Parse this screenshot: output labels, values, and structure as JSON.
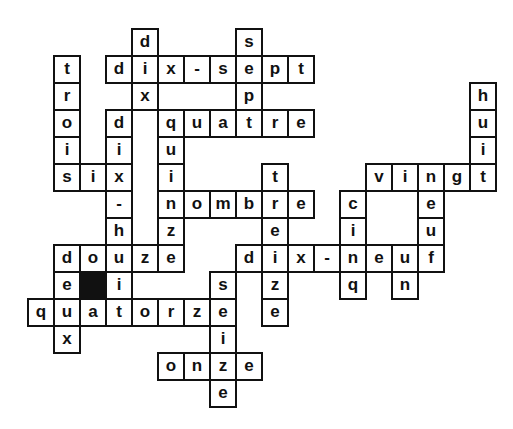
{
  "puzzle": {
    "type": "crossword",
    "language": "French",
    "theme": "numbers",
    "grid_origin": {
      "x": 27,
      "y": 28
    },
    "cell_size": {
      "w": 26,
      "h": 27
    },
    "colors": {
      "border": "#111111",
      "fill": "#ffffff",
      "block": "#111111",
      "text": "#111111"
    },
    "words": [
      {
        "word": "dix-sept",
        "dir": "across",
        "row": 1,
        "col": 3
      },
      {
        "word": "dix",
        "dir": "down",
        "row": 0,
        "col": 4
      },
      {
        "word": "sept",
        "dir": "down",
        "row": 0,
        "col": 8
      },
      {
        "word": "trois",
        "dir": "down",
        "row": 1,
        "col": 1
      },
      {
        "word": "quatre",
        "dir": "across",
        "row": 3,
        "col": 5
      },
      {
        "word": "dix-huit",
        "dir": "down",
        "row": 3,
        "col": 3
      },
      {
        "word": "quinze",
        "dir": "down",
        "row": 3,
        "col": 5
      },
      {
        "word": "six",
        "dir": "across",
        "row": 5,
        "col": 1
      },
      {
        "word": "nombre",
        "dir": "across",
        "row": 6,
        "col": 5
      },
      {
        "word": "treize",
        "dir": "down",
        "row": 5,
        "col": 9
      },
      {
        "word": "huit",
        "dir": "down",
        "row": 2,
        "col": 17
      },
      {
        "word": "vingt",
        "dir": "across",
        "row": 5,
        "col": 13
      },
      {
        "word": "neuf",
        "dir": "down",
        "row": 5,
        "col": 15
      },
      {
        "word": "cinq",
        "dir": "down",
        "row": 6,
        "col": 12
      },
      {
        "word": "douze",
        "dir": "across",
        "row": 8,
        "col": 1
      },
      {
        "word": "deux",
        "dir": "down",
        "row": 8,
        "col": 1
      },
      {
        "word": "dix-neuf",
        "dir": "across",
        "row": 8,
        "col": 8
      },
      {
        "word": "un",
        "dir": "down",
        "row": 8,
        "col": 14
      },
      {
        "word": "quatorze",
        "dir": "across",
        "row": 10,
        "col": 0
      },
      {
        "word": "seize",
        "dir": "down",
        "row": 9,
        "col": 7
      },
      {
        "word": "onze",
        "dir": "across",
        "row": 12,
        "col": 5
      }
    ],
    "blocks": [
      {
        "row": 9,
        "col": 2
      }
    ],
    "cells": [
      {
        "r": 0,
        "c": 4,
        "l": "d"
      },
      {
        "r": 0,
        "c": 8,
        "l": "s"
      },
      {
        "r": 1,
        "c": 1,
        "l": "t"
      },
      {
        "r": 1,
        "c": 3,
        "l": "d"
      },
      {
        "r": 1,
        "c": 4,
        "l": "i"
      },
      {
        "r": 1,
        "c": 5,
        "l": "x"
      },
      {
        "r": 1,
        "c": 6,
        "l": "-"
      },
      {
        "r": 1,
        "c": 7,
        "l": "s"
      },
      {
        "r": 1,
        "c": 8,
        "l": "e"
      },
      {
        "r": 1,
        "c": 9,
        "l": "p"
      },
      {
        "r": 1,
        "c": 10,
        "l": "t"
      },
      {
        "r": 2,
        "c": 1,
        "l": "r"
      },
      {
        "r": 2,
        "c": 4,
        "l": "x"
      },
      {
        "r": 2,
        "c": 8,
        "l": "p"
      },
      {
        "r": 2,
        "c": 17,
        "l": "h"
      },
      {
        "r": 3,
        "c": 1,
        "l": "o"
      },
      {
        "r": 3,
        "c": 3,
        "l": "d"
      },
      {
        "r": 3,
        "c": 5,
        "l": "q"
      },
      {
        "r": 3,
        "c": 6,
        "l": "u"
      },
      {
        "r": 3,
        "c": 7,
        "l": "a"
      },
      {
        "r": 3,
        "c": 8,
        "l": "t"
      },
      {
        "r": 3,
        "c": 9,
        "l": "r"
      },
      {
        "r": 3,
        "c": 10,
        "l": "e"
      },
      {
        "r": 3,
        "c": 17,
        "l": "u"
      },
      {
        "r": 4,
        "c": 1,
        "l": "i"
      },
      {
        "r": 4,
        "c": 3,
        "l": "i"
      },
      {
        "r": 4,
        "c": 5,
        "l": "u"
      },
      {
        "r": 4,
        "c": 17,
        "l": "i"
      },
      {
        "r": 5,
        "c": 1,
        "l": "s"
      },
      {
        "r": 5,
        "c": 2,
        "l": "i"
      },
      {
        "r": 5,
        "c": 3,
        "l": "x"
      },
      {
        "r": 5,
        "c": 5,
        "l": "i"
      },
      {
        "r": 5,
        "c": 9,
        "l": "t"
      },
      {
        "r": 5,
        "c": 13,
        "l": "v"
      },
      {
        "r": 5,
        "c": 14,
        "l": "i"
      },
      {
        "r": 5,
        "c": 15,
        "l": "n"
      },
      {
        "r": 5,
        "c": 16,
        "l": "g"
      },
      {
        "r": 5,
        "c": 17,
        "l": "t"
      },
      {
        "r": 6,
        "c": 3,
        "l": "-"
      },
      {
        "r": 6,
        "c": 5,
        "l": "n"
      },
      {
        "r": 6,
        "c": 6,
        "l": "o"
      },
      {
        "r": 6,
        "c": 7,
        "l": "m"
      },
      {
        "r": 6,
        "c": 8,
        "l": "b"
      },
      {
        "r": 6,
        "c": 9,
        "l": "r"
      },
      {
        "r": 6,
        "c": 10,
        "l": "e"
      },
      {
        "r": 6,
        "c": 12,
        "l": "c"
      },
      {
        "r": 6,
        "c": 15,
        "l": "e"
      },
      {
        "r": 7,
        "c": 3,
        "l": "h"
      },
      {
        "r": 7,
        "c": 5,
        "l": "z"
      },
      {
        "r": 7,
        "c": 9,
        "l": "e"
      },
      {
        "r": 7,
        "c": 12,
        "l": "i"
      },
      {
        "r": 7,
        "c": 15,
        "l": "u"
      },
      {
        "r": 8,
        "c": 1,
        "l": "d"
      },
      {
        "r": 8,
        "c": 2,
        "l": "o"
      },
      {
        "r": 8,
        "c": 3,
        "l": "u"
      },
      {
        "r": 8,
        "c": 4,
        "l": "z"
      },
      {
        "r": 8,
        "c": 5,
        "l": "e"
      },
      {
        "r": 8,
        "c": 8,
        "l": "d"
      },
      {
        "r": 8,
        "c": 9,
        "l": "i"
      },
      {
        "r": 8,
        "c": 10,
        "l": "x"
      },
      {
        "r": 8,
        "c": 11,
        "l": "-"
      },
      {
        "r": 8,
        "c": 12,
        "l": "n"
      },
      {
        "r": 8,
        "c": 13,
        "l": "e"
      },
      {
        "r": 8,
        "c": 14,
        "l": "u"
      },
      {
        "r": 8,
        "c": 15,
        "l": "f"
      },
      {
        "r": 9,
        "c": 1,
        "l": "e"
      },
      {
        "r": 9,
        "c": 2,
        "l": "",
        "block": true
      },
      {
        "r": 9,
        "c": 3,
        "l": "i"
      },
      {
        "r": 9,
        "c": 7,
        "l": "s"
      },
      {
        "r": 9,
        "c": 9,
        "l": "z"
      },
      {
        "r": 9,
        "c": 12,
        "l": "q"
      },
      {
        "r": 9,
        "c": 14,
        "l": "n"
      },
      {
        "r": 10,
        "c": 0,
        "l": "q"
      },
      {
        "r": 10,
        "c": 1,
        "l": "u"
      },
      {
        "r": 10,
        "c": 2,
        "l": "a"
      },
      {
        "r": 10,
        "c": 3,
        "l": "t"
      },
      {
        "r": 10,
        "c": 4,
        "l": "o"
      },
      {
        "r": 10,
        "c": 5,
        "l": "r"
      },
      {
        "r": 10,
        "c": 6,
        "l": "z"
      },
      {
        "r": 10,
        "c": 7,
        "l": "e"
      },
      {
        "r": 10,
        "c": 9,
        "l": "e"
      },
      {
        "r": 11,
        "c": 1,
        "l": "x"
      },
      {
        "r": 11,
        "c": 7,
        "l": "i"
      },
      {
        "r": 12,
        "c": 5,
        "l": "o"
      },
      {
        "r": 12,
        "c": 6,
        "l": "n"
      },
      {
        "r": 12,
        "c": 7,
        "l": "z"
      },
      {
        "r": 12,
        "c": 8,
        "l": "e"
      },
      {
        "r": 13,
        "c": 7,
        "l": "e"
      }
    ]
  }
}
